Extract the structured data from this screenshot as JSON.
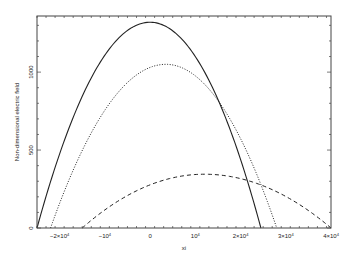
{
  "chart_data": {
    "type": "line",
    "title": "",
    "xlabel": "xi",
    "ylabel": "Non-dimensional electric field",
    "xlim": [
      -25000,
      40000
    ],
    "ylim": [
      0,
      1360
    ],
    "x_ticks": [
      {
        "value": -20000,
        "label_base": "−2×10",
        "label_exp": "4"
      },
      {
        "value": -10000,
        "label_base": "−10",
        "label_exp": "4"
      },
      {
        "value": 0,
        "label_base": "0",
        "label_exp": ""
      },
      {
        "value": 10000,
        "label_base": "10",
        "label_exp": "4"
      },
      {
        "value": 20000,
        "label_base": "2×10",
        "label_exp": "4"
      },
      {
        "value": 30000,
        "label_base": "3×10",
        "label_exp": "4"
      },
      {
        "value": 40000,
        "label_base": "4×10",
        "label_exp": "4"
      }
    ],
    "y_ticks": [
      {
        "value": 0,
        "label": "0"
      },
      {
        "value": 500,
        "label": "500"
      },
      {
        "value": 1000,
        "label": "1000"
      }
    ],
    "grid": false,
    "legend": null,
    "series": [
      {
        "name": "solid",
        "style": "solid",
        "x_start": -25000,
        "x_peak": 0,
        "y_peak": 1320,
        "x_end": 24500
      },
      {
        "name": "dotted",
        "style": "dotted",
        "x_start": -22000,
        "x_peak": 3500,
        "y_peak": 1050,
        "x_end": 28000
      },
      {
        "name": "dashed",
        "style": "dashed",
        "x_start": -15000,
        "x_peak": 12000,
        "y_peak": 345,
        "x_end": 40000
      }
    ]
  },
  "colors": {
    "line": "#222222",
    "axis": "#444444",
    "background": "#ffffff"
  }
}
